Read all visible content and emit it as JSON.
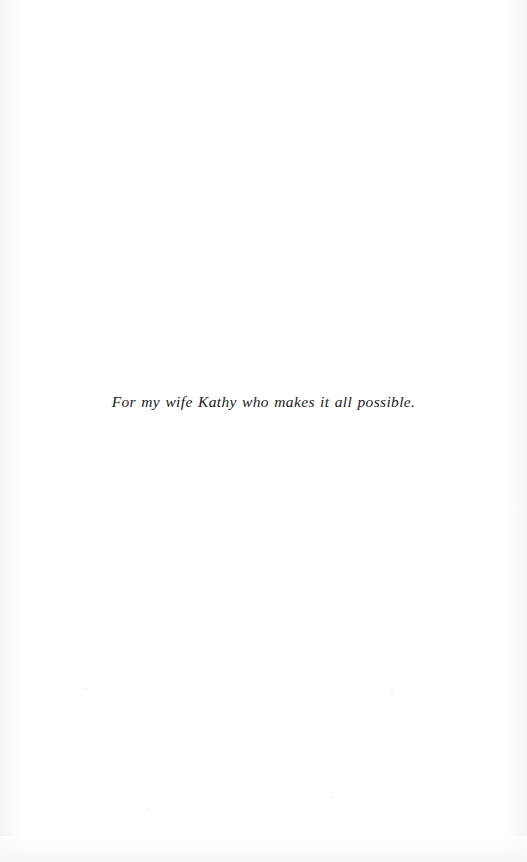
{
  "page": {
    "kind": "book-dedication-page",
    "background_color": "#ffffff",
    "width": 527,
    "height": 862
  },
  "dedication": {
    "text": "For my wife Kathy who makes it all possible.",
    "color": "#1a1a1c",
    "style": "italic-serif",
    "alignment": "center"
  },
  "artifacts": {
    "left_edge_tint": "#f3f3f5",
    "right_edge_tint": "#f4f4f6",
    "bottom_smudge_tint": "#f5f5f6"
  }
}
